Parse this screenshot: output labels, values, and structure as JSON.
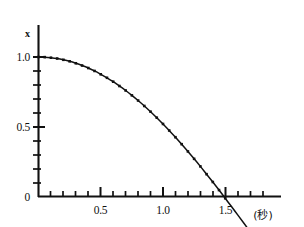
{
  "chart_data": {
    "type": "line",
    "title": "",
    "subtitle": "",
    "xlabel": "(秒)",
    "ylabel": "x",
    "xlim": [
      0,
      1.95
    ],
    "ylim": [
      -0.28,
      1.12
    ],
    "grid": false,
    "legend": null,
    "x_major_ticks": [
      0.5,
      1.0,
      1.5
    ],
    "x_major_tick_labels": [
      "0.5",
      "1.0",
      "1.5"
    ],
    "x_minor_tick_step": 0.1,
    "y_major_ticks": [
      0,
      0.5,
      1.0
    ],
    "y_major_tick_labels": [
      "0",
      "0.5",
      "1.0"
    ],
    "y_minor_tick_step": 0.1,
    "marker": "square",
    "zero_crossing_x": 1.55,
    "x": [
      0.0,
      0.05,
      0.1,
      0.15,
      0.2,
      0.25,
      0.3,
      0.35,
      0.4,
      0.45,
      0.5,
      0.55,
      0.6,
      0.65,
      0.7,
      0.75,
      0.8,
      0.85,
      0.9,
      0.95,
      1.0,
      1.05,
      1.1,
      1.15,
      1.2,
      1.25,
      1.3,
      1.35,
      1.4,
      1.45,
      1.5,
      1.55,
      1.6,
      1.65,
      1.7,
      1.75
    ],
    "y": [
      1.0,
      0.999,
      0.995,
      0.989,
      0.98,
      0.969,
      0.955,
      0.939,
      0.921,
      0.9,
      0.876,
      0.851,
      0.823,
      0.792,
      0.76,
      0.725,
      0.688,
      0.649,
      0.608,
      0.565,
      0.52,
      0.473,
      0.425,
      0.375,
      0.323,
      0.27,
      0.216,
      0.16,
      0.104,
      0.046,
      -0.013,
      -0.072,
      -0.132,
      -0.192,
      -0.252,
      -0.312
    ]
  },
  "labels": {
    "y_axis_name": "x",
    "y_tick_1_0": "1.0",
    "y_tick_0_5": "0.5",
    "y_tick_0": "0",
    "x_tick_0_5": "0.5",
    "x_tick_1_0": "1.0",
    "x_tick_1_5": "1.5",
    "x_unit": "(秒)"
  },
  "colors": {
    "ink": "#111111",
    "background": "#ffffff"
  }
}
